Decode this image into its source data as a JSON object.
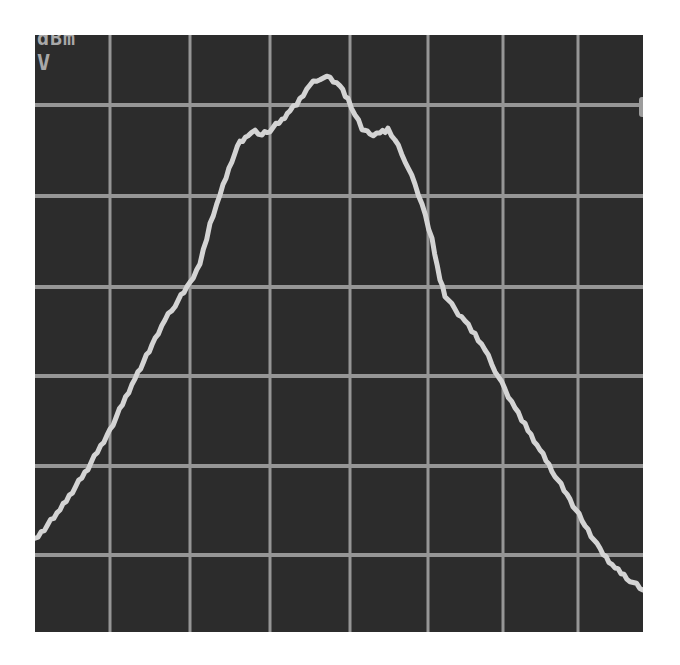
{
  "chart_data": {
    "type": "line",
    "title": "",
    "xlabel": "",
    "ylabel": "",
    "annotations": [
      "dBm",
      "V"
    ],
    "grid": true,
    "grid_divisions": {
      "x": 8,
      "y": 6.6
    },
    "legend": null,
    "colors": {
      "background": "#2c2c2c",
      "grid": "#969696",
      "trace": "#d4d4d4",
      "text": "#a8a8a8"
    },
    "x": [
      0,
      25,
      53,
      75,
      100,
      120,
      130,
      140,
      155,
      165,
      175,
      185,
      197,
      205,
      213,
      220,
      227,
      235,
      247,
      255,
      265,
      275,
      285,
      295,
      305,
      313,
      320,
      327,
      335,
      345,
      353,
      360,
      370,
      380,
      387,
      397,
      405,
      410,
      420,
      430,
      440,
      450,
      460,
      470,
      480,
      490,
      505,
      520,
      535,
      550,
      565,
      580,
      595,
      608
    ],
    "y_pixels": [
      505,
      475,
      433,
      395,
      343,
      305,
      285,
      270,
      248,
      228,
      190,
      160,
      125,
      107,
      100,
      97,
      100,
      95,
      85,
      75,
      65,
      50,
      43,
      43,
      50,
      65,
      80,
      93,
      100,
      97,
      95,
      105,
      125,
      150,
      168,
      205,
      245,
      260,
      275,
      285,
      300,
      315,
      335,
      355,
      372,
      390,
      415,
      440,
      465,
      490,
      515,
      533,
      545,
      555
    ],
    "series": [
      {
        "name": "trace",
        "description": "Broad hump-shaped spectrum; peak near center (~6.3 div from bottom), shoulders on both sides, falling to ~1 div at left edge and below bottom gridline at right edge",
        "values_div": [
          1.0,
          1.35,
          1.8,
          2.2,
          2.8,
          3.2,
          3.4,
          3.6,
          3.85,
          4.05,
          4.5,
          4.8,
          5.2,
          5.4,
          5.45,
          5.5,
          5.45,
          5.5,
          5.6,
          5.75,
          5.85,
          6.0,
          6.1,
          6.1,
          6.0,
          5.85,
          5.7,
          5.55,
          5.45,
          5.5,
          5.5,
          5.4,
          5.2,
          4.9,
          4.7,
          4.3,
          3.85,
          3.7,
          3.55,
          3.4,
          3.25,
          3.05,
          2.85,
          2.6,
          2.4,
          2.2,
          1.95,
          1.65,
          1.4,
          1.1,
          0.85,
          0.65,
          0.5,
          0.4
        ]
      }
    ],
    "gridlines_px": {
      "vertical": [
        75,
        155,
        235,
        315,
        393,
        468,
        543
      ],
      "horizontal": [
        70,
        161,
        252,
        341,
        431,
        520
      ]
    }
  },
  "display": {
    "unit_top": "dBm",
    "unit_bottom": "V"
  }
}
